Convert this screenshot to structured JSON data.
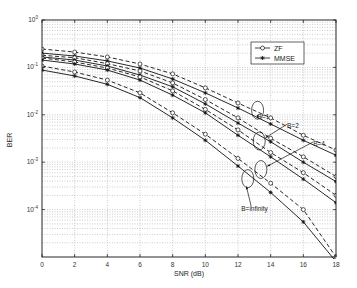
{
  "chart_data": {
    "type": "line",
    "title": "",
    "xlabel": "SNR (dB)",
    "ylabel": "BER",
    "yscale": "log",
    "xlim": [
      0,
      18
    ],
    "ylim": [
      1e-05,
      1
    ],
    "grid": true,
    "x": [
      0,
      2,
      4,
      6,
      8,
      10,
      12,
      14,
      16,
      18
    ],
    "x_ticks": [
      "0",
      "2",
      "4",
      "6",
      "8",
      "10",
      "12",
      "14",
      "16",
      "18"
    ],
    "y_ticks": [
      {
        "base": "10",
        "exp": "0",
        "value": 1
      },
      {
        "base": "10",
        "exp": "-1",
        "value": 0.1
      },
      {
        "base": "10",
        "exp": "-2",
        "value": 0.01
      },
      {
        "base": "10",
        "exp": "-3",
        "value": 0.001
      },
      {
        "base": "10",
        "exp": "-4",
        "value": 0.0001
      }
    ],
    "legend": {
      "position": "upper right",
      "entries": [
        {
          "label": "ZF",
          "marker": "circle",
          "line": "solid"
        },
        {
          "label": "MMSE",
          "marker": "asterisk",
          "line": "solid"
        }
      ]
    },
    "series": [
      {
        "name": "ZF, B=1",
        "group": "B=1",
        "marker": "circle",
        "dash": true,
        "values": [
          0.244,
          0.211,
          0.166,
          0.118,
          0.073,
          0.037,
          0.0177,
          0.0086,
          0.0037,
          0.0018
        ]
      },
      {
        "name": "MMSE, B=1",
        "group": "B=1",
        "marker": "asterisk",
        "dash": false,
        "values": [
          0.2,
          0.174,
          0.137,
          0.097,
          0.057,
          0.029,
          0.0139,
          0.0064,
          0.0029,
          0.0014
        ]
      },
      {
        "name": "ZF, B=2",
        "group": "B=2",
        "marker": "circle",
        "dash": true,
        "values": [
          0.18,
          0.16,
          0.12,
          0.084,
          0.047,
          0.021,
          0.0086,
          0.0032,
          0.0013,
          0.0005
        ]
      },
      {
        "name": "MMSE, B=2",
        "group": "B=2",
        "marker": "asterisk",
        "dash": false,
        "values": [
          0.166,
          0.143,
          0.107,
          0.069,
          0.039,
          0.017,
          0.0067,
          0.0027,
          0.001,
          0.00039
        ]
      },
      {
        "name": "ZF, B=4",
        "group": "B=4",
        "marker": "circle",
        "dash": true,
        "values": [
          0.158,
          0.13,
          0.097,
          0.063,
          0.032,
          0.013,
          0.0048,
          0.0016,
          0.0006,
          0.0002
        ]
      },
      {
        "name": "MMSE, B=4",
        "group": "B=4",
        "marker": "asterisk",
        "dash": false,
        "values": [
          0.143,
          0.118,
          0.088,
          0.054,
          0.026,
          0.011,
          0.0037,
          0.0013,
          0.00044,
          0.00014
        ]
      },
      {
        "name": "ZF, B=infinity",
        "group": "B=infinity",
        "marker": "circle",
        "dash": true,
        "values": [
          0.107,
          0.08,
          0.054,
          0.029,
          0.011,
          0.0039,
          0.0012,
          0.00036,
          0.0001,
          1e-05
        ]
      },
      {
        "name": "MMSE, B=infinity",
        "group": "B=infinity",
        "marker": "asterisk",
        "dash": false,
        "values": [
          0.088,
          0.066,
          0.044,
          0.023,
          0.0086,
          0.0029,
          0.00083,
          0.00023,
          5.5e-05,
          8e-06
        ]
      }
    ],
    "annotations": [
      {
        "text": "B=1",
        "label_x": 13.2,
        "label_y": 0.0082,
        "ellipse_x": 13.2,
        "ellipse_y": 0.0125
      },
      {
        "text": "B=2",
        "label_x": 15.0,
        "label_y": 0.0052,
        "ellipse_x": 13.3,
        "ellipse_y": 0.0028
      },
      {
        "text": "B=4",
        "label_x": 16.6,
        "label_y": 0.0022,
        "ellipse_x": 13.4,
        "ellipse_y": 0.0007
      },
      {
        "text": "B=infinity",
        "label_x": 12.2,
        "label_y": 9.5e-05,
        "ellipse_x": 12.6,
        "ellipse_y": 0.00045
      }
    ]
  },
  "colors": {
    "line": "#111111",
    "grid": "#9a9a9a",
    "background": "#ffffff"
  }
}
